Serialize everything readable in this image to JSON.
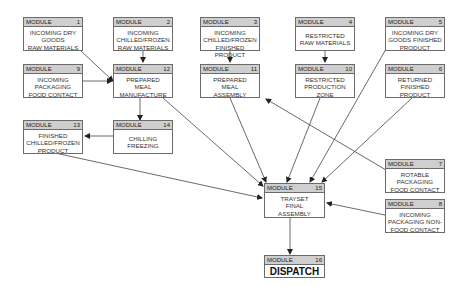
{
  "header_label": "MODULE",
  "modules": {
    "m1": {
      "num": "1",
      "text": "INCOMING DRY\nGOODS\nRAW MATERIALS"
    },
    "m2": {
      "num": "2",
      "text": "INCOMING\nCHILLED/FROZEN\nRAW MATERIALS"
    },
    "m3": {
      "num": "3",
      "text": "INCOMING\nCHILLED/FROZEN\nFINISHED PRODUCT"
    },
    "m4": {
      "num": "4",
      "text": "RESTRICTED\nRAW MATERIALS"
    },
    "m5": {
      "num": "5",
      "text": "INCOMING DRY\nGOODS FINISHED\nPRODUCT"
    },
    "m6": {
      "num": "6",
      "text": "RETURNED\nFINISHED\nPRODUCT"
    },
    "m7": {
      "num": "7",
      "text": "ROTABLE\nPACKAGING\nFOOD CONTACT"
    },
    "m8": {
      "num": "8",
      "text": "INCOMING\nPACKAGING NON-\nFOOD CONTACT"
    },
    "m9": {
      "num": "9",
      "text": "INCOMING\nPACKAGING\nFOOD CONTACT"
    },
    "m10": {
      "num": "10",
      "text": "RESTRICTED\nPRODUCTION\nZONE"
    },
    "m11": {
      "num": "11",
      "text": "PREPARED\nMEAL\nASSEMBLY"
    },
    "m12": {
      "num": "12",
      "text": "PREPARED\nMEAL\nMANUFACTURE"
    },
    "m13": {
      "num": "13",
      "text": "FINISHED\nCHILLED/FROZEN\nPRODUCT"
    },
    "m14": {
      "num": "14",
      "text": "CHILLING\nFREEZING"
    },
    "m15": {
      "num": "15",
      "text": "TRAYSET\nFINAL\nASSEMBLY"
    },
    "m16": {
      "num": "16",
      "text": "DISPATCH"
    }
  },
  "connections": [
    {
      "from": "1",
      "to": "12"
    },
    {
      "from": "9",
      "to": "12"
    },
    {
      "from": "2",
      "to": "12"
    },
    {
      "from": "3",
      "to": "11"
    },
    {
      "from": "4",
      "to": "10"
    },
    {
      "from": "12",
      "to": "14"
    },
    {
      "from": "14",
      "to": "13"
    },
    {
      "from": "12",
      "to": "15"
    },
    {
      "from": "11",
      "to": "15"
    },
    {
      "from": "10",
      "to": "15"
    },
    {
      "from": "5",
      "to": "15"
    },
    {
      "from": "6",
      "to": "15"
    },
    {
      "from": "13",
      "to": "15"
    },
    {
      "from": "7",
      "to": "11"
    },
    {
      "from": "8",
      "to": "15"
    },
    {
      "from": "15",
      "to": "16"
    }
  ]
}
